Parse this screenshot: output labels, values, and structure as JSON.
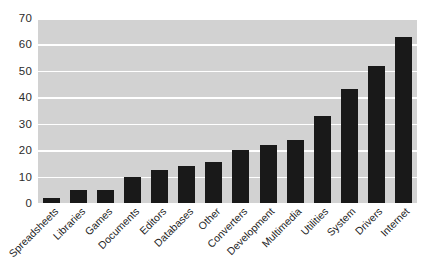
{
  "chart_data": {
    "type": "bar",
    "title": "",
    "xlabel": "",
    "ylabel": "",
    "ylim": [
      0,
      70
    ],
    "yticks": [
      0,
      10,
      20,
      30,
      40,
      50,
      60,
      70
    ],
    "grid": true,
    "legend": null,
    "categories": [
      "Spreadsheets",
      "Libraries",
      "Games",
      "Documents",
      "Editors",
      "Databases",
      "Other",
      "Converters",
      "Development",
      "Multimedia",
      "Utilities",
      "System",
      "Drivers",
      "Internet"
    ],
    "values": [
      2,
      5,
      5,
      10,
      12.5,
      14,
      15.5,
      20,
      22,
      24,
      33,
      43,
      52,
      63
    ],
    "colors": {
      "bar": "#191919",
      "plot_background": "#d2d2d2",
      "gridline": "#ffffff",
      "figure_background": "#ffffff",
      "tick_label": "#2b2b2b"
    }
  }
}
